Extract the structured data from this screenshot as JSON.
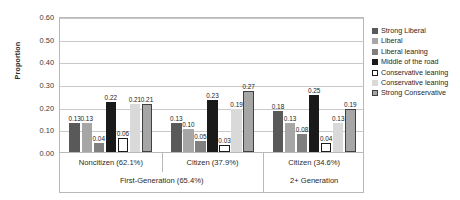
{
  "chart_data": {
    "type": "bar",
    "title": "",
    "xlabel": "",
    "ylabel": "Proportion",
    "ylim": [
      0.0,
      0.6
    ],
    "yticks": [
      "0.00",
      "0.10",
      "0.20",
      "0.30",
      "0.40",
      "0.50",
      "0.60"
    ],
    "grid": true,
    "legend_position": "right",
    "categories": [
      "Noncitizen (62.1%)",
      "Citizen (37.9%)",
      "Citizen (34.6%)"
    ],
    "super_categories": [
      {
        "label": "First-Generation (65.4%)",
        "spans": 2
      },
      {
        "label": "2+ Generation",
        "spans": 1
      }
    ],
    "series": [
      {
        "name": "Strong Liberal",
        "values": [
          0.13,
          0.13,
          0.18
        ],
        "color": "#595959",
        "border": "#595959"
      },
      {
        "name": "Liberal",
        "values": [
          0.13,
          0.1,
          0.13
        ],
        "color": "#a6a6a6",
        "border": "#a6a6a6"
      },
      {
        "name": "Liberal leaning",
        "values": [
          0.04,
          0.05,
          0.08
        ],
        "color": "#7f7f7f",
        "border": "#7f7f7f"
      },
      {
        "name": "Middle of the road",
        "values": [
          0.22,
          0.23,
          0.25
        ],
        "color": "#1a1a1a",
        "border": "#1a1a1a"
      },
      {
        "name": "Conservative leaning",
        "values": [
          0.06,
          0.03,
          0.04
        ],
        "color": "#ffffff",
        "border": "#1a1a1a"
      },
      {
        "name": "Conservative leaning",
        "values": [
          0.21,
          0.19,
          0.13
        ],
        "color": "#d9d9d9",
        "border": "#d9d9d9"
      },
      {
        "name": "Strong Conservative",
        "values": [
          0.21,
          0.27,
          0.19
        ],
        "color": "#a6a6a6",
        "border": "#404040"
      }
    ],
    "data_labels": [
      [
        "0.13",
        "0.13",
        "0.04",
        "0.22",
        "0.06",
        "0.21",
        "0.21"
      ],
      [
        "0.13",
        "0.10",
        "0.05",
        "0.23",
        "0.03",
        "0.19",
        "0.27"
      ],
      [
        "0.18",
        "0.13",
        "0.08",
        "0.25",
        "0.04",
        "0.13",
        "0.19"
      ]
    ]
  },
  "legend": {
    "items": [
      {
        "label": "Strong Liberal"
      },
      {
        "label": "Liberal"
      },
      {
        "label": "Liberal leaning"
      },
      {
        "label": "Middle of the road"
      },
      {
        "label": "Conservative leaning"
      },
      {
        "label": "Conservative leaning"
      },
      {
        "label": "Strong Conservative"
      }
    ]
  }
}
